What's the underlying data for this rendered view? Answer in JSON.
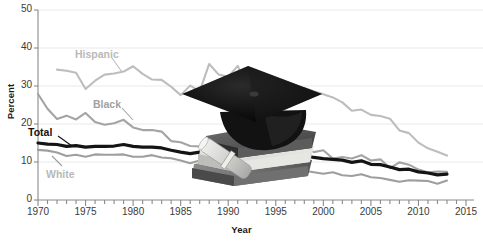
{
  "chart_data": {
    "type": "line",
    "title": "",
    "xlabel": "Year",
    "ylabel": "Percent",
    "xlim": [
      1970,
      2015
    ],
    "ylim": [
      0,
      50
    ],
    "ytick_values": [
      0,
      10,
      20,
      30,
      40,
      50
    ],
    "ytick_labels": [
      "0",
      "10",
      "20",
      "30",
      "40",
      "50"
    ],
    "xtick_labels": [
      "1970",
      "1975",
      "1980",
      "1985",
      "1990",
      "1995",
      "2000",
      "2005",
      "2010",
      "2015"
    ],
    "xtick_values": [
      1970,
      1975,
      1980,
      1985,
      1990,
      1995,
      2000,
      2005,
      2010,
      2015
    ],
    "minor_xticks": "every 1 year",
    "grid": "horizontal only",
    "legend": "inline series labels with leader lines",
    "x": [
      1970,
      1971,
      1972,
      1973,
      1974,
      1975,
      1976,
      1977,
      1978,
      1979,
      1980,
      1981,
      1982,
      1983,
      1984,
      1985,
      1986,
      1987,
      1988,
      1989,
      1990,
      1991,
      1992,
      1993,
      1994,
      1995,
      1996,
      1997,
      1998,
      1999,
      2000,
      2001,
      2002,
      2003,
      2004,
      2005,
      2006,
      2007,
      2008,
      2009,
      2010,
      2011,
      2012,
      2013
    ],
    "series": [
      {
        "name": "Hispanic",
        "color": "#bdbdbd",
        "width": 2.1,
        "label_color": "#b9b9b9",
        "values": [
          null,
          null,
          34.3,
          34.0,
          33.5,
          29.2,
          31.4,
          33.0,
          33.3,
          33.8,
          35.2,
          33.2,
          31.7,
          31.6,
          29.8,
          27.6,
          30.1,
          28.6,
          35.8,
          33.0,
          32.4,
          35.3,
          29.4,
          27.5,
          30.0,
          30.0,
          29.4,
          25.3,
          29.5,
          28.6,
          27.8,
          27.0,
          25.7,
          23.5,
          23.8,
          22.4,
          22.1,
          21.4,
          18.3,
          17.6,
          15.1,
          13.6,
          12.7,
          11.7
        ]
      },
      {
        "name": "Black",
        "color": "#a4a4a4",
        "width": 2.1,
        "label_color": "#a0a0a0",
        "values": [
          27.9,
          24.0,
          21.3,
          22.2,
          21.2,
          22.9,
          20.5,
          19.8,
          20.2,
          21.1,
          19.1,
          18.4,
          18.4,
          18.0,
          15.5,
          15.2,
          14.2,
          14.1,
          14.5,
          13.9,
          13.2,
          13.6,
          13.7,
          13.6,
          12.6,
          12.1,
          13.0,
          13.4,
          13.8,
          12.6,
          13.1,
          10.9,
          11.3,
          10.9,
          11.8,
          10.4,
          10.7,
          8.4,
          9.9,
          9.3,
          8.0,
          7.3,
          7.5,
          7.4
        ]
      },
      {
        "name": "Total",
        "color": "#141414",
        "width": 3.2,
        "label_color": "#111111",
        "values": [
          15.0,
          14.7,
          14.6,
          14.1,
          14.3,
          13.9,
          14.1,
          14.1,
          14.2,
          14.6,
          14.1,
          13.9,
          13.9,
          13.7,
          13.1,
          12.6,
          12.2,
          12.6,
          12.9,
          12.6,
          12.1,
          12.5,
          11.0,
          11.0,
          11.4,
          12.0,
          11.1,
          11.0,
          11.8,
          11.2,
          10.9,
          10.7,
          10.5,
          9.9,
          10.3,
          9.4,
          9.3,
          8.7,
          8.0,
          8.1,
          7.4,
          7.1,
          6.6,
          6.8
        ]
      },
      {
        "name": "White",
        "color": "#9e9e9e",
        "width": 2.1,
        "label_color": "#b9b9b9",
        "values": [
          13.2,
          13.0,
          12.5,
          11.6,
          11.9,
          11.4,
          12.0,
          11.9,
          11.9,
          12.0,
          11.4,
          11.4,
          11.8,
          11.2,
          11.0,
          10.4,
          9.7,
          10.4,
          9.6,
          9.4,
          9.0,
          8.9,
          7.7,
          7.9,
          7.7,
          8.6,
          7.3,
          7.6,
          7.7,
          7.3,
          6.9,
          7.3,
          6.5,
          6.3,
          6.8,
          6.0,
          5.8,
          5.3,
          4.8,
          5.2,
          5.1,
          5.0,
          4.3,
          5.1
        ]
      }
    ],
    "annotations": [
      {
        "text": "Hispanic",
        "x": 1977,
        "y": 38
      },
      {
        "text": "Black",
        "x": 1981,
        "y": 24
      },
      {
        "text": "Total",
        "x": 1971,
        "y": 18
      },
      {
        "text": "White",
        "x": 1973,
        "y": 8
      }
    ],
    "overlay_image": "graduation-cap-on-books-with-diploma-photo"
  },
  "axes": {
    "y_title": "Percent",
    "x_title": "Year"
  }
}
